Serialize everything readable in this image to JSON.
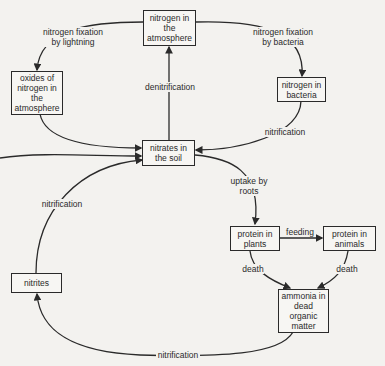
{
  "diagram": {
    "nodes": {
      "atmosphere": "nitrogen in the atmosphere",
      "oxides": "oxides of nitrogen in the atmosphere",
      "bacteria": "nitrogen in bacteria",
      "nitrates": "nitrates in the soil",
      "plants": "protein in plants",
      "animals": "protein in animals",
      "ammonia": "ammonia in dead organic matter",
      "nitrites": "nitrites"
    },
    "edges": {
      "lightning": "nitrogen fixation\nby lightning",
      "fix_bacteria": "nitrogen fixation\nby bacteria",
      "denitrification": "denitrification",
      "nitrification_bacteria": "nitrification",
      "uptake": "uptake by\nroots",
      "feeding": "feeding",
      "death_plants": "death",
      "death_animals": "death",
      "nitrification_nitrites": "nitrification",
      "nitrification_ammonia": "nitrification"
    },
    "colors": {
      "line": "#2a2a2a",
      "background": "#f3f2ef"
    }
  }
}
